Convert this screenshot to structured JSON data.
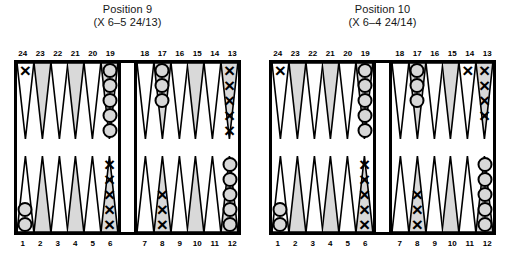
{
  "figure": {
    "type": "backgammon-position-diagram",
    "colors": {
      "frame": "#000000",
      "point_shaded": "#d9d9d9",
      "point_light": "#ffffff",
      "checker_o_fill": "#d8d8d8",
      "checker_outline": "#000000",
      "background": "#ffffff"
    }
  },
  "boards": [
    {
      "id": "board-1",
      "title": "Position 9",
      "subtitle": "(X 6–5 24/13)",
      "top_numbers": [
        "24",
        "23",
        "22",
        "21",
        "20",
        "19",
        "18",
        "17",
        "16",
        "15",
        "14",
        "13"
      ],
      "bottom_numbers": [
        "1",
        "2",
        "3",
        "4",
        "5",
        "6",
        "7",
        "8",
        "9",
        "10",
        "11",
        "12"
      ],
      "points": {
        "24": {
          "checker": "X",
          "count": 1
        },
        "23": {
          "checker": "",
          "count": 0
        },
        "22": {
          "checker": "",
          "count": 0
        },
        "21": {
          "checker": "",
          "count": 0
        },
        "20": {
          "checker": "",
          "count": 0
        },
        "19": {
          "checker": "O",
          "count": 5
        },
        "18": {
          "checker": "",
          "count": 0
        },
        "17": {
          "checker": "O",
          "count": 3
        },
        "16": {
          "checker": "",
          "count": 0
        },
        "15": {
          "checker": "",
          "count": 0
        },
        "14": {
          "checker": "",
          "count": 0
        },
        "13": {
          "checker": "X",
          "count": 5
        },
        "12": {
          "checker": "O",
          "count": 5
        },
        "11": {
          "checker": "",
          "count": 0
        },
        "10": {
          "checker": "",
          "count": 0
        },
        "9": {
          "checker": "",
          "count": 0
        },
        "8": {
          "checker": "X",
          "count": 3
        },
        "7": {
          "checker": "",
          "count": 0
        },
        "6": {
          "checker": "X",
          "count": 5
        },
        "5": {
          "checker": "",
          "count": 0
        },
        "4": {
          "checker": "",
          "count": 0
        },
        "3": {
          "checker": "",
          "count": 0
        },
        "2": {
          "checker": "",
          "count": 0
        },
        "1": {
          "checker": "O",
          "count": 2
        }
      }
    },
    {
      "id": "board-2",
      "title": "Position 10",
      "subtitle": "(X 6–4 24/14)",
      "top_numbers": [
        "24",
        "23",
        "22",
        "21",
        "20",
        "19",
        "18",
        "17",
        "16",
        "15",
        "14",
        "13"
      ],
      "bottom_numbers": [
        "1",
        "2",
        "3",
        "4",
        "5",
        "6",
        "7",
        "8",
        "9",
        "10",
        "11",
        "12"
      ],
      "points": {
        "24": {
          "checker": "X",
          "count": 1
        },
        "23": {
          "checker": "",
          "count": 0
        },
        "22": {
          "checker": "",
          "count": 0
        },
        "21": {
          "checker": "",
          "count": 0
        },
        "20": {
          "checker": "",
          "count": 0
        },
        "19": {
          "checker": "O",
          "count": 5
        },
        "18": {
          "checker": "",
          "count": 0
        },
        "17": {
          "checker": "O",
          "count": 3
        },
        "16": {
          "checker": "",
          "count": 0
        },
        "15": {
          "checker": "",
          "count": 0
        },
        "14": {
          "checker": "X",
          "count": 1
        },
        "13": {
          "checker": "X",
          "count": 4
        },
        "12": {
          "checker": "O",
          "count": 5
        },
        "11": {
          "checker": "",
          "count": 0
        },
        "10": {
          "checker": "",
          "count": 0
        },
        "9": {
          "checker": "",
          "count": 0
        },
        "8": {
          "checker": "X",
          "count": 3
        },
        "7": {
          "checker": "",
          "count": 0
        },
        "6": {
          "checker": "X",
          "count": 5
        },
        "5": {
          "checker": "",
          "count": 0
        },
        "4": {
          "checker": "",
          "count": 0
        },
        "3": {
          "checker": "",
          "count": 0
        },
        "2": {
          "checker": "",
          "count": 0
        },
        "1": {
          "checker": "O",
          "count": 2
        }
      }
    }
  ]
}
